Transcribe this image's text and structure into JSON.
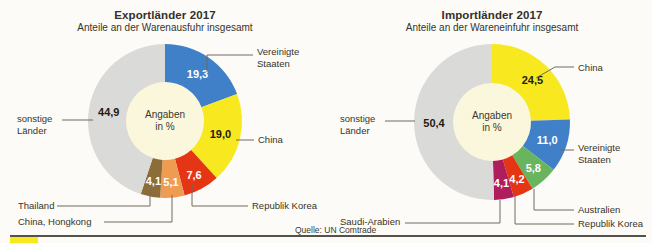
{
  "footer": {
    "source": "Quelle: UN Comtrade",
    "accent_color": "#f8e820"
  },
  "chart_data": [
    {
      "type": "pie",
      "title": "Exportländer 2017",
      "subtitle": "Anteile an der Warenausfuhr insgesamt",
      "center_label": [
        "Angaben",
        "in %"
      ],
      "slices": [
        {
          "label": "Vereinigte Staaten",
          "value": 19.3,
          "display": "19,3",
          "color": "#4080c8",
          "text_color": "#ffffff"
        },
        {
          "label": "China",
          "value": 19.0,
          "display": "19,0",
          "color": "#f8e820",
          "text_color": "#1e1b12"
        },
        {
          "label": "Republik Korea",
          "value": 7.6,
          "display": "7,6",
          "color": "#e43514",
          "text_color": "#ffffff"
        },
        {
          "label": "China, Hongkong",
          "value": 5.1,
          "display": "5,1",
          "color": "#f09b52",
          "text_color": "#ffffff"
        },
        {
          "label": "Thailand",
          "value": 4.1,
          "display": "4,1",
          "color": "#8c6d39",
          "text_color": "#ffffff"
        },
        {
          "label": "sonstige Länder",
          "value": 44.9,
          "display": "44,9",
          "color": "#dadad8",
          "text_color": "#1e1b12"
        }
      ]
    },
    {
      "type": "pie",
      "title": "Importländer 2017",
      "subtitle": "Anteile an der Wareneinfuhr insgesamt",
      "center_label": [
        "Angaben",
        "in %"
      ],
      "slices": [
        {
          "label": "China",
          "value": 24.5,
          "display": "24,5",
          "color": "#f8e820",
          "text_color": "#1e1b12"
        },
        {
          "label": "Vereinigte Staaten",
          "value": 11.0,
          "display": "11,0",
          "color": "#4080c8",
          "text_color": "#ffffff"
        },
        {
          "label": "Australien",
          "value": 5.8,
          "display": "5,8",
          "color": "#68b55e",
          "text_color": "#ffffff"
        },
        {
          "label": "Republik Korea",
          "value": 4.2,
          "display": "4,2",
          "color": "#e43514",
          "text_color": "#ffffff"
        },
        {
          "label": "Saudi-Arabien",
          "value": 4.1,
          "display": "4,1",
          "color": "#b01d5c",
          "text_color": "#ffffff"
        },
        {
          "label": "sonstige Länder",
          "value": 50.4,
          "display": "50,4",
          "color": "#dadad8",
          "text_color": "#1e1b12"
        }
      ]
    }
  ]
}
